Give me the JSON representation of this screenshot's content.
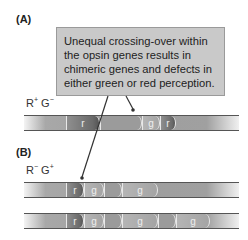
{
  "panels": {
    "A": {
      "label": "(A)"
    },
    "B": {
      "label": "(B)"
    }
  },
  "callout": {
    "text": "Unequal crossing-over within the opsin genes results in chimeric genes and defects in either green or red perception."
  },
  "genotypes": {
    "A": {
      "R": "R",
      "R_sup": "+",
      "G": "G",
      "G_sup": "−"
    },
    "B": {
      "R": "R",
      "R_sup": "−",
      "G": "G",
      "G_sup": "+"
    }
  },
  "chromosomes": [
    {
      "id": "A",
      "segments": [
        {
          "label": "r",
          "type": "r"
        },
        {
          "label": "g",
          "type": "g"
        },
        {
          "label": "r",
          "type": "r"
        }
      ]
    },
    {
      "id": "B1",
      "segments": [
        {
          "label": "r",
          "type": "r"
        },
        {
          "label": "g",
          "type": "g"
        },
        {
          "label": "g",
          "type": "g"
        }
      ]
    },
    {
      "id": "B2",
      "segments": [
        {
          "label": "r",
          "type": "r"
        },
        {
          "label": "g",
          "type": "g"
        },
        {
          "label": "g",
          "type": "g"
        },
        {
          "label": "g",
          "type": "g"
        }
      ]
    }
  ],
  "colors": {
    "callout_bg": "#c9c9c9",
    "chromosome_gray": "#9e9e9e",
    "red_gene_dark": "#6a6a6a",
    "leader_line": "#333333"
  }
}
